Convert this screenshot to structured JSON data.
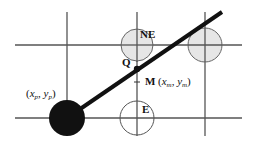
{
  "diagram": {
    "type": "midpoint-line-algorithm",
    "grid": {
      "vertical_x": [
        67,
        137,
        205
      ],
      "horizontal_y": [
        45,
        118
      ],
      "color": "#555555"
    },
    "line": {
      "from": [
        67,
        118
      ],
      "to": [
        222,
        12
      ],
      "color": "#111111",
      "width": 4
    },
    "points": [
      {
        "id": "P",
        "label_parts": [
          "(",
          "x",
          "p",
          ", ",
          "y",
          "p",
          ")"
        ],
        "cx": 67,
        "cy": 118,
        "r": 18,
        "fill": "#111111"
      },
      {
        "id": "NE",
        "label": "NE",
        "cx": 137,
        "cy": 45,
        "r": 16,
        "fill": "#e6e6e6"
      },
      {
        "id": "NE2",
        "label": "",
        "cx": 205,
        "cy": 45,
        "r": 17,
        "fill": "#e6e6e6"
      },
      {
        "id": "E",
        "label": "E",
        "cx": 137,
        "cy": 118,
        "r": 17,
        "fill": "#ffffff"
      },
      {
        "id": "M",
        "label": "M",
        "cx": 137,
        "cy": 69,
        "r": 3,
        "fill": "#111111"
      }
    ],
    "labels": {
      "ne": "NE",
      "e": "E",
      "q": "Q",
      "m": "M",
      "m_coords": {
        "open": "(",
        "x": "x",
        "x_sub": "m",
        "comma": ", ",
        "y": "y",
        "y_sub": "m",
        "close": ")"
      },
      "p_coords": {
        "open": "(",
        "x": "x",
        "x_sub": "p",
        "comma": ", ",
        "y": "y",
        "y_sub": "p",
        "close": ")"
      }
    }
  }
}
